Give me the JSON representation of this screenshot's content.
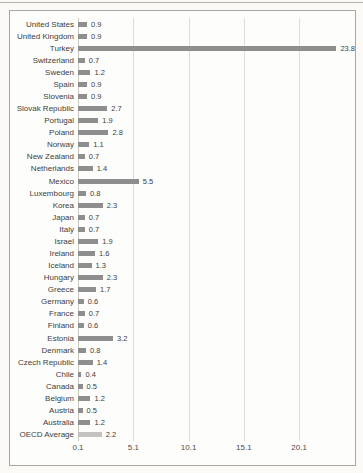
{
  "colors": {
    "bar": "#8e8e8e",
    "highlight_bar": "#c4c3c0",
    "gridline": "#dddcd8",
    "border": "#a8a8a3",
    "text": "#3d3d3d"
  },
  "chart_data": {
    "type": "bar",
    "orientation": "horizontal",
    "title": "",
    "xlabel": "",
    "ylabel": "",
    "grid": "vertical-gridlines-on",
    "legend": "none",
    "xlim": [
      0.1,
      24.7
    ],
    "x_ticks": [
      0.1,
      5.1,
      10.1,
      15.1,
      20.1
    ],
    "x_tick_labels": [
      "0.1",
      "5.1",
      "10.1",
      "15.1",
      "20.1"
    ],
    "categories": [
      "United States",
      "United Kingdom",
      "Turkey",
      "Switzerland",
      "Sweden",
      "Spain",
      "Slovenia",
      "Slovak Republic",
      "Portugal",
      "Poland",
      "Norway",
      "New Zealand",
      "Netherlands",
      "Mexico",
      "Luxembourg",
      "Korea",
      "Japan",
      "Italy",
      "Israel",
      "Ireland",
      "Iceland",
      "Hungary",
      "Greece",
      "Germany",
      "France",
      "Finland",
      "Estonia",
      "Denmark",
      "Czech Republic",
      "Chile",
      "Canada",
      "Belgium",
      "Austria",
      "Australia",
      "OECD Average"
    ],
    "values": [
      0.9,
      0.9,
      23.8,
      0.7,
      1.2,
      0.9,
      0.9,
      2.7,
      1.9,
      2.8,
      1.1,
      0.7,
      1.4,
      5.5,
      0.8,
      2.3,
      0.7,
      0.7,
      1.9,
      1.6,
      1.3,
      2.3,
      1.7,
      0.6,
      0.7,
      0.6,
      3.2,
      0.8,
      1.4,
      0.4,
      0.5,
      1.2,
      0.5,
      1.2,
      2.2
    ],
    "data_labels": [
      "0.9",
      "0.9",
      "23.8",
      "0.7",
      "1.2",
      "0.9",
      "0.9",
      "2.7",
      "1.9",
      "2.8",
      "1.1",
      "0.7",
      "1.4",
      "5.5",
      "0.8",
      "2.3",
      "0.7",
      "0.7",
      "1.9",
      "1.6",
      "1.3",
      "2.3",
      "1.7",
      "0.6",
      "0.7",
      "0.6",
      "3.2",
      "0.8",
      "1.4",
      "0.4",
      "0.5",
      "1.2",
      "0.5",
      "1.2",
      "2.2"
    ],
    "highlight_category": "OECD Average"
  }
}
